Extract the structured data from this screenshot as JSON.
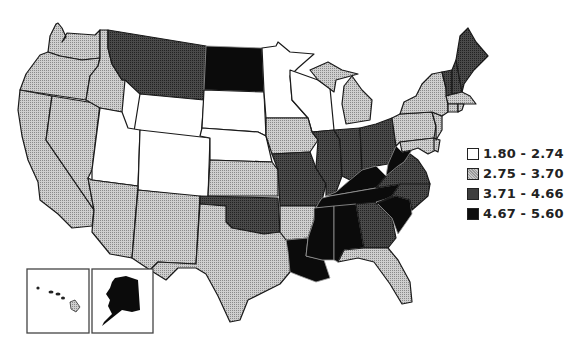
{
  "legend": {
    "items": [
      {
        "label": "1.80 - 2.74",
        "fill": "#ffffff",
        "class": "c1"
      },
      {
        "label": "2.75 - 3.70",
        "fill": "#bdbdbd",
        "class": "c2"
      },
      {
        "label": "3.71 - 4.66",
        "fill": "#3e3e3e",
        "class": "c3"
      },
      {
        "label": "4.67 - 5.60",
        "fill": "#0d0d0d",
        "class": "c4"
      }
    ]
  },
  "map": {
    "type": "choropleth",
    "region": "United States",
    "insets": [
      "Hawaii",
      "Alaska"
    ],
    "states": {
      "WA": "2.75 - 3.70",
      "OR": "2.75 - 3.70",
      "CA": "2.75 - 3.70",
      "NV": "2.75 - 3.70",
      "ID": "2.75 - 3.70",
      "AZ": "2.75 - 3.70",
      "NM": "2.75 - 3.70",
      "TX": "2.75 - 3.70",
      "KS": "2.75 - 3.70",
      "IA": "2.75 - 3.70",
      "AR": "2.75 - 3.70",
      "MI": "2.75 - 3.70",
      "NY": "2.75 - 3.70",
      "PA": "2.75 - 3.70",
      "NJ": "2.75 - 3.70",
      "MD": "2.75 - 3.70",
      "DE": "2.75 - 3.70",
      "CT": "2.75 - 3.70",
      "MA": "2.75 - 3.70",
      "RI": "2.75 - 3.70",
      "FL": "2.75 - 3.70",
      "HI": "2.75 - 3.70",
      "UT": "1.80 - 2.74",
      "WY": "1.80 - 2.74",
      "CO": "1.80 - 2.74",
      "SD": "1.80 - 2.74",
      "NE": "1.80 - 2.74",
      "MN": "1.80 - 2.74",
      "WI": "1.80 - 2.74",
      "MT": "3.71 - 4.66",
      "OK": "3.71 - 4.66",
      "MO": "3.71 - 4.66",
      "IL": "3.71 - 4.66",
      "IN": "3.71 - 4.66",
      "OH": "3.71 - 4.66",
      "VA": "3.71 - 4.66",
      "NC": "3.71 - 4.66",
      "GA": "3.71 - 4.66",
      "ME": "3.71 - 4.66",
      "NH": "3.71 - 4.66",
      "VT": "3.71 - 4.66",
      "ND": "4.67 - 5.60",
      "KY": "4.67 - 5.60",
      "TN": "4.67 - 5.60",
      "WV": "4.67 - 5.60",
      "MS": "4.67 - 5.60",
      "AL": "4.67 - 5.60",
      "LA": "4.67 - 5.60",
      "SC": "4.67 - 5.60",
      "AK": "4.67 - 5.60"
    }
  }
}
